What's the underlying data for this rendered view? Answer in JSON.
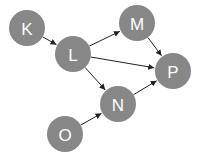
{
  "diagram": {
    "type": "directed-graph",
    "node_color": "#878787",
    "label_color": "#ffffff",
    "edge_color": "#222222",
    "nodes": [
      {
        "id": "K",
        "label": "K"
      },
      {
        "id": "L",
        "label": "L"
      },
      {
        "id": "M",
        "label": "M"
      },
      {
        "id": "P",
        "label": "P"
      },
      {
        "id": "N",
        "label": "N"
      },
      {
        "id": "O",
        "label": "O"
      }
    ],
    "edges": [
      {
        "from": "K",
        "to": "L"
      },
      {
        "from": "L",
        "to": "M"
      },
      {
        "from": "L",
        "to": "P"
      },
      {
        "from": "L",
        "to": "N"
      },
      {
        "from": "M",
        "to": "P"
      },
      {
        "from": "N",
        "to": "P"
      },
      {
        "from": "O",
        "to": "N"
      }
    ]
  }
}
